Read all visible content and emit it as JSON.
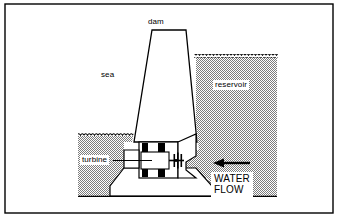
{
  "figure": {
    "kind": "tidal-barrage-cross-section",
    "frame": {
      "border_color": "#000000",
      "background_color": "#ffffff"
    }
  },
  "labels": {
    "dam": "dam",
    "sea": "sea",
    "reservoir": "reservoir",
    "turbine": "turbine",
    "water_flow_line1": "WATER",
    "water_flow_line2": "FLOW"
  },
  "colors": {
    "outline": "#000000",
    "water_fill": "#b3b3b3",
    "structure_fill": "#ffffff",
    "label_background": "#ffffff",
    "machine_block": "#000000"
  },
  "parts": {
    "dam_wall": "dam",
    "sea_water": "sea",
    "reservoir_water": "reservoir",
    "turbine_housing": "turbine",
    "turbine_runner": "turbine-runner",
    "flow_arrow": "water-flow-arrow",
    "sea_surface": "sea-water-surface",
    "reservoir_surface": "reservoir-water-surface",
    "seabed": "seabed"
  },
  "annotations": {
    "flow_direction": "right-to-left",
    "sea_level_y": 136,
    "reservoir_level_y": 57
  }
}
